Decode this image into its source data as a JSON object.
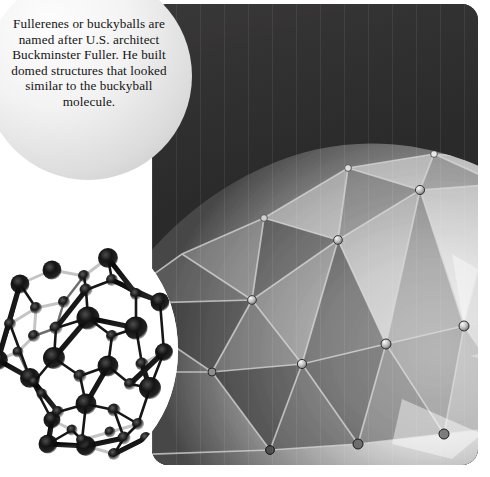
{
  "page": {
    "background_color": "#ffffff",
    "width": 490,
    "height": 477
  },
  "callout": {
    "shape": "circle",
    "fill_light": "#fdfdfd",
    "fill_dark": "#bfbfbf",
    "text_color": "#141414",
    "text": "Fullerenes or buckyballs are named after U.S. architect Buckminster Fuller. He built domed structures that looked similar to the buckyball molecule.",
    "lines": [
      "Fullerenes",
      "or buckyballs are",
      "named after U.S.",
      "architect Buckminster",
      "Fuller. He built domed",
      "structures that looked",
      "similar to the",
      "buckyball",
      "molecule."
    ]
  },
  "photo": {
    "subject": "geodesic-dome",
    "description": "Grayscale photograph of a geodesic dome with triangular translucent panels and metal hub rings at the vertices, against a dark night sky.",
    "sky_color": "#2b2a2a",
    "panel_light": "#f2f2f2",
    "panel_dark": "#1f1f1f",
    "corner_radius_px": 16
  },
  "molecule": {
    "name": "buckyball",
    "formula": "C60",
    "description": "Ball-and-stick model of a C60 fullerene molecule drawn with dark spherical atoms and light and dark bond rods on a white circular field.",
    "atom_color": "#111111",
    "bond_dark_color": "#1a1a1a",
    "bond_light_color": "#c9c9c9",
    "field_color": "#ffffff"
  }
}
